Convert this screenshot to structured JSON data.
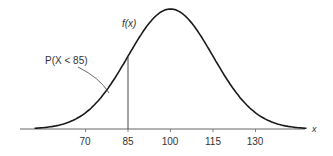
{
  "chart_data": {
    "type": "line",
    "title": "",
    "xlabel": "x",
    "ylabel": "f(x)",
    "distribution": {
      "name": "normal",
      "mean": 100,
      "sd": 15
    },
    "x_ticks": [
      70,
      85,
      100,
      115,
      130
    ],
    "xlim": [
      45,
      150
    ],
    "grid": false,
    "annotations": [
      {
        "text": "P(X < 85)",
        "points_to": "area under curve left of x = 85"
      },
      {
        "text": "f(x)",
        "position": "near curve at x = 85"
      },
      {
        "type": "vertical_line",
        "x": 85
      }
    ]
  },
  "labels": {
    "fx": "f(x)",
    "prob": "P(X < 85)",
    "xaxis": "x",
    "ticks": [
      "70",
      "85",
      "100",
      "115",
      "130"
    ]
  },
  "colors": {
    "line": "#1a1a1a",
    "axis": "#555555",
    "text": "#333333"
  }
}
